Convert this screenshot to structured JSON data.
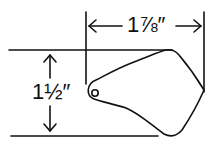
{
  "diagram": {
    "width_label": "1⅞″",
    "height_label": "1½″",
    "stroke_color": "#111111",
    "background": "#ffffff"
  }
}
